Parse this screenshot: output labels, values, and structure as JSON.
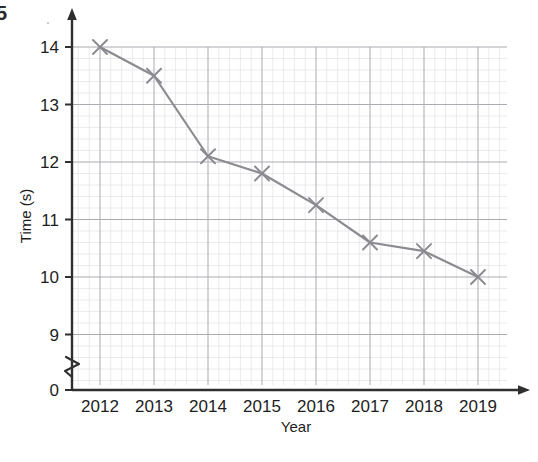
{
  "figure": {
    "corner_mark": "5",
    "background_color": "#ffffff"
  },
  "chart_data": {
    "type": "line",
    "title": "",
    "xlabel": "Year",
    "ylabel": "Time (s)",
    "categories": [
      "2012",
      "2013",
      "2014",
      "2015",
      "2016",
      "2017",
      "2018",
      "2019"
    ],
    "x": [
      2012,
      2013,
      2014,
      2015,
      2016,
      2017,
      2018,
      2019
    ],
    "values": [
      14.0,
      13.5,
      12.1,
      11.8,
      11.25,
      10.6,
      10.45,
      10.0
    ],
    "series": [
      {
        "name": "Time",
        "values": [
          14.0,
          13.5,
          12.1,
          11.8,
          11.25,
          10.6,
          10.45,
          10.0
        ]
      }
    ],
    "xlim": [
      2011.5,
      2019.55
    ],
    "ylim": [
      8.6,
      14.15
    ],
    "ytick_labels": [
      "0",
      "9",
      "10",
      "11",
      "12",
      "13",
      "14"
    ],
    "yticks": [
      0,
      9,
      10,
      11,
      12,
      13,
      14
    ],
    "xtick_labels": [
      "2012",
      "2013",
      "2014",
      "2015",
      "2016",
      "2017",
      "2018",
      "2019"
    ],
    "y_axis_break": true,
    "y_axis_break_label": "zigzag-break",
    "grid": true,
    "grid_major_step": 1,
    "grid_minor_per_major": 5,
    "grid_major_color": "#a9abb0",
    "grid_minor_color": "#e2e3e6",
    "line_color": "#8b8b91",
    "marker": "x",
    "marker_color": "#8b8b91",
    "legend": "none",
    "axis_color": "#2f2f2f"
  }
}
